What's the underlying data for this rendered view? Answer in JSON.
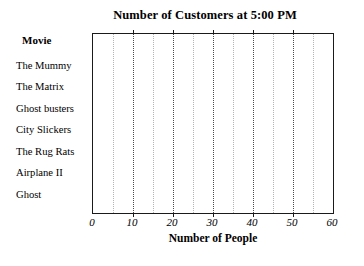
{
  "chart_data": {
    "type": "bar",
    "orientation": "horizontal",
    "title": "Number of Customers at 5:00 PM",
    "xlabel": "Number of People",
    "ylabel": "Movie",
    "categories": [
      "The Mummy",
      "The Matrix",
      "Ghost busters",
      "City Slickers",
      "The Rug Rats",
      "Airplane II",
      "Ghost"
    ],
    "values": [
      null,
      null,
      null,
      null,
      null,
      null,
      null
    ],
    "xlim": [
      0,
      60
    ],
    "xticks": [
      0,
      10,
      20,
      30,
      40,
      50,
      60
    ],
    "xtick_labels": [
      "0",
      "10",
      "20",
      "30",
      "40",
      "50",
      "60"
    ],
    "minor_xticks": [
      5,
      15,
      25,
      35,
      45,
      55
    ],
    "grid": true,
    "grid_style": "dotted",
    "legend": false,
    "note": "Blank worksheet grid — no bars are drawn for any category",
    "colors": {
      "frame": "#1a1a1a",
      "major_gridline": "#4a4a4a",
      "minor_gridline": "#b4b4b4",
      "background": "#ffffff",
      "text": "#000000"
    }
  }
}
